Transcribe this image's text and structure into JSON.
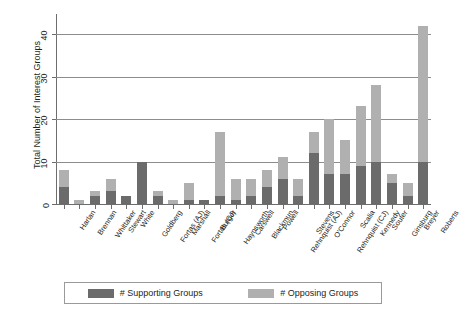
{
  "chart_data": {
    "type": "bar",
    "subtype": "stacked-vertical",
    "title": "",
    "xlabel": "",
    "ylabel": "Total Number of Interest Groups",
    "ylim": [
      0,
      44
    ],
    "yticks": [
      0,
      10,
      20,
      30,
      40
    ],
    "ytick_labels": [
      "0",
      "10",
      "20",
      "30",
      "40"
    ],
    "grid": "horizontal",
    "legend_position": "bottom",
    "categories": [
      "Harlan",
      "Brennan",
      "Whittaker",
      "Stewart",
      "White",
      "Goldberg",
      "Fortas (AJ)",
      "Marshall",
      "Fortas (CJ)",
      "Burger",
      "Haynsworth",
      "Carswell",
      "Blackmun",
      "Powell",
      "Rehnquist (AJ)",
      "Stevens",
      "O'Connor",
      "Rehnquist (CJ)",
      "Scalia",
      "Kennedy",
      "Souter",
      "Ginsburg",
      "Breyer",
      "Roberts"
    ],
    "series": [
      {
        "name": "# Supporting Groups",
        "color": "#6b6b6b",
        "values": [
          4,
          0,
          2,
          3,
          2,
          10,
          2,
          0,
          1,
          1,
          2,
          1,
          2,
          4,
          6,
          2,
          12,
          7,
          7,
          9,
          10,
          5,
          2,
          10
        ]
      },
      {
        "name": "# Opposing Groups",
        "color": "#b0b0b0",
        "values": [
          4,
          1,
          1,
          3,
          0,
          0,
          1,
          1,
          4,
          0,
          15,
          5,
          4,
          4,
          5,
          4,
          5,
          13,
          8,
          14,
          18,
          2,
          3,
          32
        ]
      }
    ],
    "totals": [
      8,
      1,
      3,
      6,
      2,
      10,
      3,
      1,
      5,
      1,
      17,
      6,
      6,
      8,
      11,
      6,
      17,
      20,
      15,
      23,
      28,
      7,
      5,
      42
    ]
  },
  "legend": {
    "items": [
      {
        "label": "# Supporting Groups",
        "color": "#6b6b6b"
      },
      {
        "label": "# Opposing Groups",
        "color": "#b0b0b0"
      }
    ]
  },
  "colors": {
    "supporting": "#6b6b6b",
    "opposing": "#b0b0b0",
    "grid": "#8d8d8d",
    "axis": "#6d6d6d",
    "text": "#231f20",
    "background": "#ffffff"
  }
}
